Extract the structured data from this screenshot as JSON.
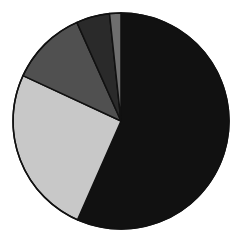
{
  "chart_data": {
    "type": "pie",
    "title": "",
    "legend": [],
    "start_angle_deg": 0,
    "direction": "clockwise",
    "center": [
      121,
      121
    ],
    "radius": 108,
    "slices": [
      {
        "label": "",
        "value": 56.6,
        "color": "#111111"
      },
      {
        "label": "",
        "value": 25.3,
        "color": "#c8c8c8"
      },
      {
        "label": "",
        "value": 11.4,
        "color": "#505050"
      },
      {
        "label": "",
        "value": 5.0,
        "color": "#2a2a2a"
      },
      {
        "label": "",
        "value": 1.7,
        "color": "#6e6e6e"
      }
    ],
    "values": [
      56.6,
      25.3,
      11.4,
      5.0,
      1.7
    ],
    "categories": [
      "",
      "",
      "",
      "",
      ""
    ]
  },
  "colors": {
    "background": "#ffffff",
    "stroke": "#111111"
  }
}
